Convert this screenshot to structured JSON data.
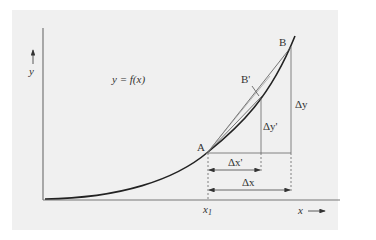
{
  "figure": {
    "background_color": "#f0f0f0",
    "line_color": "#222222",
    "curve_label": "y = f(x)",
    "y_axis_label": "y",
    "x_axis_label": "x",
    "x1_label": "x",
    "x1_subscript": "1",
    "points": {
      "A": "A",
      "B": "B",
      "B_prime": "B'"
    },
    "deltas": {
      "dy": "Δy",
      "dy_prime": "Δy'",
      "dx": "Δx",
      "dx_prime": "Δx'"
    }
  }
}
